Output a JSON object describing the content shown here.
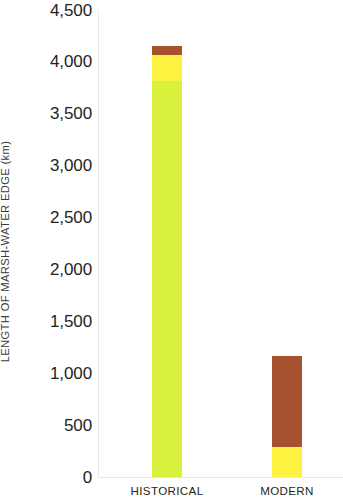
{
  "chart_data": {
    "type": "bar",
    "subtype": "stacked",
    "title": "",
    "xlabel": "",
    "ylabel": "LENGTH OF MARSH-WATER EDGE (km)",
    "categories": [
      "HISTORICAL",
      "MODERN"
    ],
    "ylim": [
      0,
      4500
    ],
    "ytick_values": [
      0,
      500,
      1000,
      1500,
      2000,
      2500,
      3000,
      3500,
      4000,
      4500
    ],
    "ytick_labels": [
      "0",
      "500",
      "1,000",
      "1,500",
      "2,000",
      "2,500",
      "3,000",
      "3,500",
      "4,000",
      "4,500"
    ],
    "grid": false,
    "legend": null,
    "series": [
      {
        "name": "yellow-green",
        "color": "#d9f03c",
        "values": [
          3820,
          0
        ]
      },
      {
        "name": "yellow",
        "color": "#fdf23f",
        "values": [
          250,
          290
        ]
      },
      {
        "name": "brown",
        "color": "#a8512f",
        "values": [
          80,
          880
        ]
      }
    ],
    "totals": [
      4150,
      1170
    ],
    "annotations": []
  },
  "axis": {
    "y_title": "LENGTH OF MARSH-WATER EDGE (km)",
    "ticks": [
      {
        "label": "4,500",
        "value": 4500
      },
      {
        "label": "4,000",
        "value": 4000
      },
      {
        "label": "3,500",
        "value": 3500
      },
      {
        "label": "3,000",
        "value": 3000
      },
      {
        "label": "2,500",
        "value": 2500
      },
      {
        "label": "2,000",
        "value": 2000
      },
      {
        "label": "1,500",
        "value": 1500
      },
      {
        "label": "1,000",
        "value": 1000
      },
      {
        "label": "500",
        "value": 500
      },
      {
        "label": "0",
        "value": 0
      }
    ]
  },
  "categories": [
    {
      "label": "HISTORICAL"
    },
    {
      "label": "MODERN"
    }
  ],
  "colors": {
    "yellow_green": "#d9f03c",
    "yellow": "#fdf23f",
    "brown": "#a8512f",
    "axis_line": "#e7e9e9",
    "text": "#231f20",
    "background": "#ffffff"
  }
}
